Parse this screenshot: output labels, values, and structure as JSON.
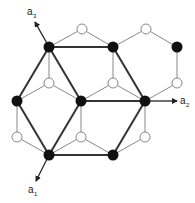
{
  "diagram": {
    "colors": {
      "background": "#ffffff",
      "line": "#333333",
      "thin_line": "#888888",
      "black_node": "#111111",
      "white_node_fill": "#ffffff",
      "white_node_stroke": "#888888"
    },
    "black_nodes": [
      {
        "id": "A",
        "x": 49,
        "y": 47
      },
      {
        "id": "B",
        "x": 113,
        "y": 47
      },
      {
        "id": "C",
        "x": 177,
        "y": 47
      },
      {
        "id": "D",
        "x": 17,
        "y": 101
      },
      {
        "id": "E",
        "x": 81,
        "y": 101
      },
      {
        "id": "F",
        "x": 145,
        "y": 101
      },
      {
        "id": "G",
        "x": 49,
        "y": 155
      },
      {
        "id": "H",
        "x": 113,
        "y": 155
      }
    ],
    "white_nodes": [
      {
        "id": "w1",
        "x": 82,
        "y": 29
      },
      {
        "id": "w2",
        "x": 146,
        "y": 29
      },
      {
        "id": "w3",
        "x": 49,
        "y": 83
      },
      {
        "id": "w4",
        "x": 113,
        "y": 83
      },
      {
        "id": "w5",
        "x": 177,
        "y": 83
      },
      {
        "id": "w6",
        "x": 17,
        "y": 137
      },
      {
        "id": "w7",
        "x": 81,
        "y": 137
      },
      {
        "id": "w8",
        "x": 145,
        "y": 137
      }
    ],
    "thin_edges": [
      [
        "A",
        "w1"
      ],
      [
        "w1",
        "B"
      ],
      [
        "B",
        "w2"
      ],
      [
        "w2",
        "C"
      ],
      [
        "C",
        "w5"
      ],
      [
        "w5",
        "F"
      ],
      [
        "A",
        "w3"
      ],
      [
        "w3",
        "D"
      ],
      [
        "w3",
        "E"
      ],
      [
        "B",
        "w4"
      ],
      [
        "w4",
        "E"
      ],
      [
        "w4",
        "F"
      ],
      [
        "D",
        "w6"
      ],
      [
        "w6",
        "G"
      ],
      [
        "E",
        "w7"
      ],
      [
        "w7",
        "G"
      ],
      [
        "w7",
        "H"
      ],
      [
        "F",
        "w8"
      ],
      [
        "w8",
        "H"
      ]
    ],
    "thick_edges": [
      [
        "A",
        "B"
      ],
      [
        "A",
        "D"
      ],
      [
        "A",
        "E"
      ],
      [
        "B",
        "F"
      ],
      [
        "E",
        "F"
      ],
      [
        "D",
        "G"
      ],
      [
        "E",
        "G"
      ],
      [
        "G",
        "H"
      ],
      [
        "F",
        "H"
      ]
    ],
    "vectors": [
      {
        "name": "a1",
        "label": "a",
        "subscript": "1",
        "from": "G",
        "to": {
          "x": 36,
          "y": 181
        },
        "label_pos": {
          "x": 28,
          "y": 193
        }
      },
      {
        "name": "a2",
        "label": "a",
        "subscript": "2",
        "from": "F",
        "to": {
          "x": 177,
          "y": 101
        },
        "label_pos": {
          "x": 180,
          "y": 104
        }
      },
      {
        "name": "a3",
        "label": "a",
        "subscript": "3",
        "from": "A",
        "to": {
          "x": 35,
          "y": 22
        },
        "label_pos": {
          "x": 27,
          "y": 15
        }
      }
    ]
  }
}
